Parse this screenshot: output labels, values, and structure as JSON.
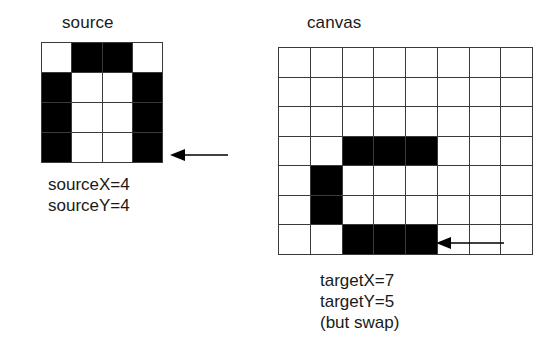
{
  "figure": {
    "background_color": "#ffffff",
    "ink_color": "#000000",
    "grid_line_color": "#3a3a3a"
  },
  "source_panel": {
    "title": "source",
    "grid": {
      "columns": 4,
      "rows": 4,
      "filled_cells": [
        [
          0,
          1
        ],
        [
          0,
          2
        ],
        [
          1,
          0
        ],
        [
          1,
          3
        ],
        [
          2,
          0
        ],
        [
          2,
          3
        ],
        [
          3,
          0
        ],
        [
          3,
          3
        ]
      ],
      "pattern": [
        [
          0,
          1,
          1,
          0
        ],
        [
          1,
          0,
          0,
          1
        ],
        [
          1,
          0,
          0,
          1
        ],
        [
          1,
          0,
          0,
          1
        ]
      ]
    },
    "pointer": {
      "icon": "left-arrow-icon",
      "direction": "left",
      "points_at": "source-grid-bottom-right-cell"
    },
    "caption_lines": [
      "sourceX=4",
      "sourceY=4"
    ]
  },
  "canvas_panel": {
    "title": "canvas",
    "grid": {
      "columns": 8,
      "rows": 7,
      "filled_cells": [
        [
          3,
          2
        ],
        [
          3,
          3
        ],
        [
          3,
          4
        ],
        [
          4,
          1
        ],
        [
          5,
          1
        ],
        [
          6,
          2
        ],
        [
          6,
          3
        ],
        [
          6,
          4
        ]
      ],
      "pattern": [
        [
          0,
          0,
          0,
          0,
          0,
          0,
          0,
          0
        ],
        [
          0,
          0,
          0,
          0,
          0,
          0,
          0,
          0
        ],
        [
          0,
          0,
          0,
          0,
          0,
          0,
          0,
          0
        ],
        [
          0,
          0,
          1,
          1,
          1,
          0,
          0,
          0
        ],
        [
          0,
          1,
          0,
          0,
          0,
          0,
          0,
          0
        ],
        [
          0,
          1,
          0,
          0,
          0,
          0,
          0,
          0
        ],
        [
          0,
          0,
          1,
          1,
          1,
          0,
          0,
          0
        ]
      ]
    },
    "pointer": {
      "icon": "left-arrow-icon",
      "direction": "left",
      "points_at": "canvas-cell-row6-col4"
    },
    "caption_lines": [
      "targetX=7",
      "targetY=5",
      "(but swap)"
    ]
  }
}
